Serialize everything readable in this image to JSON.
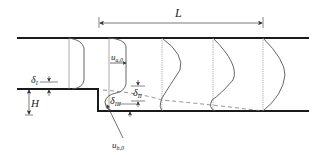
{
  "diagram": {
    "type": "backward-facing step flow with velocity profiles",
    "labels": {
      "length": "L",
      "step_height": "H",
      "delta_1_base": "δ",
      "delta_1_sub": "I",
      "delta_2_base": "δ",
      "delta_2_sub": "II",
      "delta_3_base": "δ",
      "delta_3_sub": "III",
      "u_a_base": "u",
      "u_a_sub": "a,0",
      "u_b_base": "u",
      "u_b_sub": "b,0"
    },
    "colors": {
      "wall": "#1a1a1a",
      "profile": "#555555",
      "station": "#888888",
      "dashed": "#777777",
      "dimension": "#444444"
    },
    "stations_x": [
      69,
      109,
      162,
      213,
      263
    ]
  }
}
